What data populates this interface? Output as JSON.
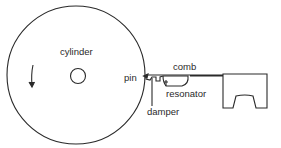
{
  "diagram": {
    "labels": {
      "cylinder": "cylinder",
      "pin": "pin",
      "comb": "comb",
      "resonator": "resonator",
      "damper": "damper"
    },
    "icons": {
      "rotation_arrow": "down-arrow"
    },
    "colors": {
      "stroke": "#2a2a2a",
      "background": "#ffffff"
    }
  }
}
